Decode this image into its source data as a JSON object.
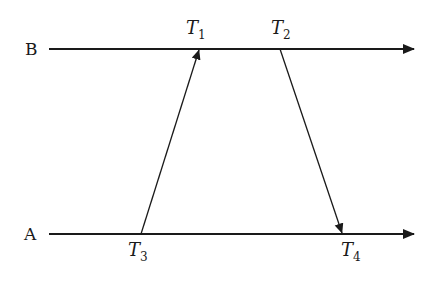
{
  "diagram": {
    "type": "timing-sequence",
    "lines": [
      {
        "id": "B",
        "label": "B",
        "y": 49,
        "x_start": 49,
        "x_end": 414
      },
      {
        "id": "A",
        "label": "A",
        "y": 234,
        "x_start": 49,
        "x_end": 414
      }
    ],
    "messages": [
      {
        "from": "A",
        "to": "B",
        "send_time": "T3",
        "receive_time": "T1",
        "x_send": 141,
        "x_receive": 199
      },
      {
        "from": "B",
        "to": "A",
        "send_time": "T2",
        "receive_time": "T4",
        "x_send": 280,
        "x_receive": 342
      }
    ],
    "time_labels": {
      "t1": {
        "base": "T",
        "sub": "1"
      },
      "t2": {
        "base": "T",
        "sub": "2"
      },
      "t3": {
        "base": "T",
        "sub": "3"
      },
      "t4": {
        "base": "T",
        "sub": "4"
      }
    },
    "colors": {
      "line": "#1a1a1a",
      "background": "#ffffff"
    }
  }
}
